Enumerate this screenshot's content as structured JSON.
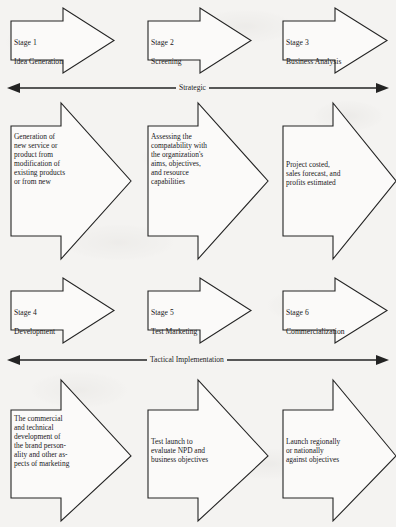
{
  "diagram": {
    "background_color": "#f4f3f1",
    "line_color": "#242424",
    "shape_fill": "#fbfaf9"
  },
  "rows": {
    "stage_row_1": {
      "name": "strategic-stages",
      "stages": [
        {
          "number": "Stage 1",
          "name": "Idea Generation"
        },
        {
          "number": "Stage 2",
          "name": "Screening"
        },
        {
          "number": "Stage 3",
          "name": "Business Analysis"
        }
      ]
    },
    "detail_row_1": {
      "name": "strategic-details",
      "items": [
        {
          "text": "Generation of\nnew service or\nproduct from\nmodification of\nexisting products\nor from new"
        },
        {
          "text": "Assessing the\ncompatability with\nthe organization's\naims, objectives,\nand resource\ncapabilities"
        },
        {
          "text": "Project costed,\nsales forecast, and\nprofits estimated"
        }
      ]
    },
    "stage_row_2": {
      "name": "tactical-stages",
      "stages": [
        {
          "number": "Stage 4",
          "name": "Development"
        },
        {
          "number": "Stage 5",
          "name": "Test Marketing"
        },
        {
          "number": "Stage 6",
          "name": "Commercialization"
        }
      ]
    },
    "detail_row_2": {
      "name": "tactical-details",
      "items": [
        {
          "text": "The commercial\nand technical\ndevelopment of\nthe brand person-\nality and other as-\npects of marketing"
        },
        {
          "text": "Test launch to\nevaluate NPD and\nbusiness objectives"
        },
        {
          "text": "Launch regionally\nor nationally\nagainst objectives"
        }
      ]
    }
  },
  "axes": [
    {
      "name": "strategic-axis",
      "label": "Strategic"
    },
    {
      "name": "tactical-axis",
      "label": "Tactical Implementation"
    }
  ]
}
